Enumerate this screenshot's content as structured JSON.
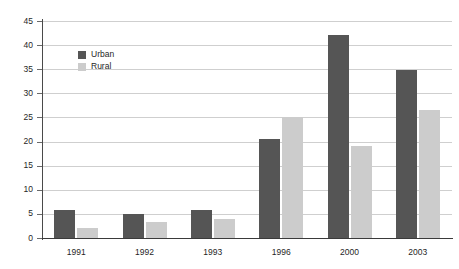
{
  "chart_data": {
    "type": "bar",
    "title": "",
    "subtitle": "",
    "xlabel": "",
    "ylabel": "",
    "categories": [
      "1991",
      "1992",
      "1993",
      "1996",
      "2000",
      "2003"
    ],
    "series": [
      {
        "name": "Urban",
        "color": "#555555",
        "values": [
          5.8,
          5.0,
          5.8,
          20.5,
          42.0,
          34.8
        ]
      },
      {
        "name": "Rural",
        "color": "#cccccc",
        "values": [
          2.0,
          3.3,
          4.0,
          25.0,
          19.0,
          26.5
        ]
      }
    ],
    "ylim": [
      0,
      45
    ],
    "ytick_step": 5,
    "yticks": [
      "0",
      "5",
      "10",
      "15",
      "20",
      "25",
      "30",
      "35",
      "40",
      "45"
    ],
    "grid": true,
    "grid_axis": "y",
    "legend_position": "upper-left-inside"
  },
  "legend": {
    "items": [
      {
        "label": "Urban",
        "color": "#555555"
      },
      {
        "label": "Rural",
        "color": "#cccccc"
      }
    ]
  },
  "axes": {
    "y_tick_labels": [
      "45",
      "40",
      "35",
      "30",
      "25",
      "20",
      "15",
      "10",
      "5",
      "0"
    ],
    "x_tick_labels": [
      "1991",
      "1992",
      "1993",
      "1996",
      "2000",
      "2003"
    ]
  }
}
